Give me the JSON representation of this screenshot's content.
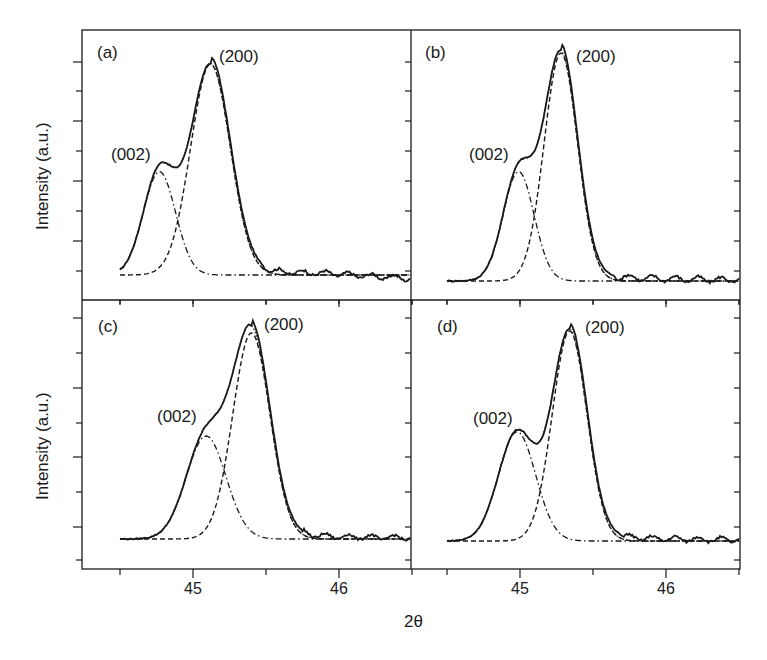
{
  "figure": {
    "xlabel": "2θ",
    "ylabel": "Intensity (a.u.)",
    "colors": {
      "line": "#1a1a1a",
      "background": "#ffffff"
    }
  },
  "chart_data": [
    {
      "type": "line",
      "panel": "(a)",
      "xlabel": "2θ",
      "ylabel": "Intensity (a.u.)",
      "xlim": [
        44.35,
        46.6
      ],
      "xticks": [
        44.5,
        45,
        45.5,
        46,
        46.5
      ],
      "xtick_labels": [
        "45",
        "46"
      ],
      "annotations": [
        "(002)",
        "(200)"
      ],
      "series": [
        {
          "name": "measured",
          "style": "solid"
        },
        {
          "name": "(002) fit",
          "style": "dash-dot",
          "center": 44.77,
          "height": 0.49,
          "fwhm": 0.26
        },
        {
          "name": "(200) fit",
          "style": "dashed",
          "center": 45.12,
          "height": 1.0,
          "fwhm": 0.32
        },
        {
          "name": "sum fit",
          "style": "dotted"
        }
      ]
    },
    {
      "type": "line",
      "panel": "(b)",
      "xlabel": "2θ",
      "ylabel": "Intensity (a.u.)",
      "xlim": [
        44.35,
        46.6
      ],
      "xticks": [
        44.5,
        45,
        45.5,
        46,
        46.5
      ],
      "xtick_labels": [
        "45",
        "46"
      ],
      "annotations": [
        "(002)",
        "(200)"
      ],
      "series": [
        {
          "name": "measured",
          "style": "solid"
        },
        {
          "name": "(002) fit",
          "style": "dash-dot",
          "center": 44.99,
          "height": 0.48,
          "fwhm": 0.25
        },
        {
          "name": "(200) fit",
          "style": "dashed",
          "center": 45.28,
          "height": 1.0,
          "fwhm": 0.27
        },
        {
          "name": "sum fit",
          "style": "dotted"
        }
      ]
    },
    {
      "type": "line",
      "panel": "(c)",
      "xlabel": "2θ",
      "ylabel": "Intensity (a.u.)",
      "xlim": [
        44.35,
        46.6
      ],
      "xticks": [
        44.5,
        45,
        45.5,
        46,
        46.5
      ],
      "xtick_labels": [
        "45",
        "46"
      ],
      "annotations": [
        "(002)",
        "(200)"
      ],
      "series": [
        {
          "name": "measured",
          "style": "solid"
        },
        {
          "name": "(002) fit",
          "style": "dash-dot",
          "center": 45.09,
          "height": 0.5,
          "fwhm": 0.32
        },
        {
          "name": "(200) fit",
          "style": "dashed",
          "center": 45.4,
          "height": 1.0,
          "fwhm": 0.3
        },
        {
          "name": "sum fit",
          "style": "dotted"
        }
      ]
    },
    {
      "type": "line",
      "panel": "(d)",
      "xlabel": "2θ",
      "ylabel": "Intensity (a.u.)",
      "xlim": [
        44.35,
        46.6
      ],
      "xticks": [
        44.5,
        45,
        45.5,
        46,
        46.5
      ],
      "xtick_labels": [
        "45",
        "46"
      ],
      "annotations": [
        "(002)",
        "(200)"
      ],
      "series": [
        {
          "name": "measured",
          "style": "solid"
        },
        {
          "name": "(002) fit",
          "style": "dash-dot",
          "center": 44.98,
          "height": 0.52,
          "fwhm": 0.3
        },
        {
          "name": "(200) fit",
          "style": "dashed",
          "center": 45.34,
          "height": 1.0,
          "fwhm": 0.28
        },
        {
          "name": "sum fit",
          "style": "dotted"
        }
      ]
    }
  ]
}
